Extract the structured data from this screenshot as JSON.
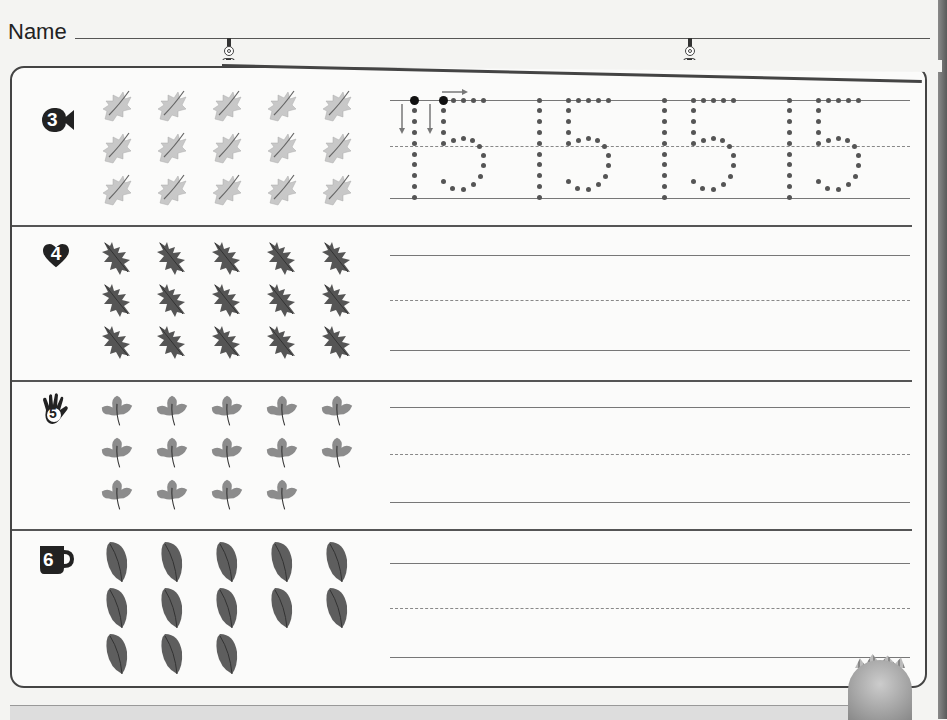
{
  "header": {
    "name_label": "Name",
    "name_value": ""
  },
  "sections": [
    {
      "number": "3",
      "badge_shape": "fish-icon",
      "object": "oak-leaf-light",
      "count": 15,
      "rows": [
        5,
        5,
        5
      ],
      "tracing_number": "15",
      "traced_copies": 4
    },
    {
      "number": "4",
      "badge_shape": "heart-icon",
      "object": "oak-leaf-dark",
      "count": 15,
      "rows": [
        5,
        5,
        5
      ],
      "answer": ""
    },
    {
      "number": "5",
      "badge_shape": "hand-icon",
      "object": "maple-leaf",
      "count": 14,
      "rows": [
        5,
        5,
        4
      ],
      "answer": ""
    },
    {
      "number": "6",
      "badge_shape": "cup-icon",
      "object": "oval-leaf",
      "count": 13,
      "rows": [
        5,
        5,
        3
      ],
      "answer": ""
    }
  ],
  "colors": {
    "ink": "#222222",
    "line": "#777777",
    "paper": "#f4f4f2",
    "leaf_light": "#c8c8c8",
    "leaf_dark": "#555555",
    "leaf_mid": "#8c8c8c",
    "leaf_oval": "#5e5e5e"
  }
}
